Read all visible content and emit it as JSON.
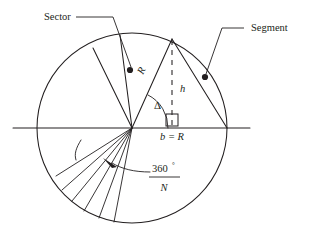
{
  "figure": {
    "background_color": "#ffffff",
    "ink_color": "#231f20"
  },
  "labels": {
    "sector": "Sector",
    "segment": "Segment",
    "radius": "R",
    "height": "h",
    "delta": "Δ",
    "base": "b = R",
    "angle_numerator": "360",
    "angle_degree_symbol": "°",
    "angle_denominator": "N"
  },
  "geometry": {
    "circle": {
      "cx": 132,
      "cy": 128,
      "r": 95
    },
    "center_point": {
      "x": 132,
      "y": 128
    },
    "apex_point": {
      "x": 172,
      "y": 39
    },
    "right_edge_point": {
      "x": 227,
      "y": 128
    },
    "foot_point": {
      "x": 172,
      "y": 128
    },
    "horizontal_axis": {
      "x1": 13,
      "y1": 128,
      "x2": 250,
      "y2": 128
    },
    "sector_radius_a": {
      "x": 93,
      "y": 48
    },
    "sector_radius_b": {
      "x": 120,
      "y": 35
    },
    "sector_marker_dot": {
      "x": 130,
      "y": 70
    },
    "segment_marker_dot": {
      "x": 205,
      "y": 77
    },
    "right_angle_square": {
      "x": 166,
      "y": 114,
      "size": 12
    },
    "fan_line_count": 6
  },
  "annotations": {
    "sector_leader": "leader line from Sector label to sector region dot",
    "segment_leader": "leader line from Segment label to segment region dot",
    "angle_leaders": "two curved arrows pointing at the fan of sector divider lines"
  }
}
